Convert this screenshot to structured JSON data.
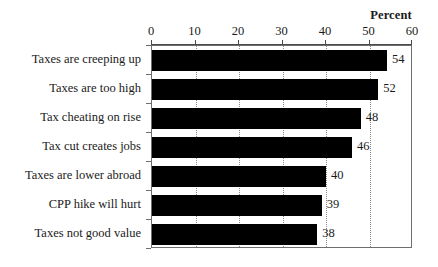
{
  "chart_data": {
    "type": "bar",
    "orientation": "horizontal",
    "title": "",
    "subtitle": "",
    "xlabel": "Percent",
    "ylabel": "",
    "categories": [
      "Taxes are creeping up",
      "Taxes are too high",
      "Tax cheating on rise",
      "Tax cut creates jobs",
      "Taxes are lower abroad",
      "CPP hike will hurt",
      "Taxes not good value"
    ],
    "values": [
      54,
      52,
      48,
      46,
      40,
      39,
      38
    ],
    "value_labels": [
      "54",
      "52",
      "48",
      "46",
      "40",
      "39",
      "38"
    ],
    "xlim": [
      0,
      60
    ],
    "xticks": [
      0,
      10,
      20,
      30,
      40,
      50,
      60
    ],
    "xtick_labels": [
      "0",
      "10",
      "20",
      "30",
      "40",
      "50",
      "60"
    ],
    "grid": "vertical-dotted",
    "legend": "none",
    "bar_color": "#000000",
    "frame_color": "#6e6e6e",
    "background_color": "#ffffff",
    "axis_position": "top"
  }
}
